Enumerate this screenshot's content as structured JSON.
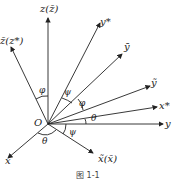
{
  "diagram": {
    "origin_label": "O",
    "axes": [
      {
        "id": "z",
        "label": "z(z̄)"
      },
      {
        "id": "zbar",
        "label": "z̄(z*)"
      },
      {
        "id": "ystar",
        "label": "y*"
      },
      {
        "id": "ybar",
        "label": "ȳ"
      },
      {
        "id": "ytilde",
        "label": "ỹ"
      },
      {
        "id": "xstar",
        "label": "x*"
      },
      {
        "id": "y",
        "label": "y"
      },
      {
        "id": "xtilde",
        "label": "x̃(x̄)"
      },
      {
        "id": "x",
        "label": "x"
      }
    ],
    "angles": [
      {
        "id": "phi_top",
        "label": "φ"
      },
      {
        "id": "psi_top",
        "label": "ψ"
      },
      {
        "id": "phi_mid",
        "label": "φ"
      },
      {
        "id": "theta_right",
        "label": "θ"
      },
      {
        "id": "psi_bottom",
        "label": "ψ"
      },
      {
        "id": "theta_bottom",
        "label": "θ"
      }
    ],
    "caption": "图 1-1"
  }
}
